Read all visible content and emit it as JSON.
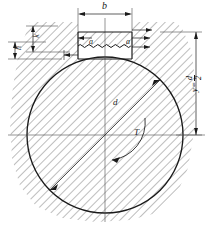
{
  "drawing": {
    "title": "Shaft cross-section with keyway",
    "type": "engineering-section-view",
    "colors": {
      "line": "#1a1a1a",
      "hatch": "#5a5a5a",
      "thin": "#4d4d4d",
      "background": "#ffffff"
    },
    "labels": {
      "keyway_width": "b",
      "key_side_left": "a",
      "key_side_right": "a",
      "height_h": "h",
      "height_k": "k",
      "diameter": "d",
      "torque": "T",
      "radius_y": "y",
      "radius_eq": "=",
      "radius_num": "d",
      "radius_den": "2"
    },
    "geometry": {
      "circle_cx": 105,
      "circle_cy": 135,
      "circle_r": 78,
      "keyway_x": 78,
      "keyway_y": 32,
      "keyway_w": 54,
      "keyway_h": 27
    },
    "elements": {
      "hatching": "45-degree-section-hatch",
      "keyway": "rectangular-keyway",
      "wavy_line": "break-line-zigzag",
      "diameter_line": "diagonal-diameter-with-arrows",
      "torque_arc": "curved-arrow-torque",
      "center_lines": "horizontal-and-vertical-axes"
    }
  }
}
